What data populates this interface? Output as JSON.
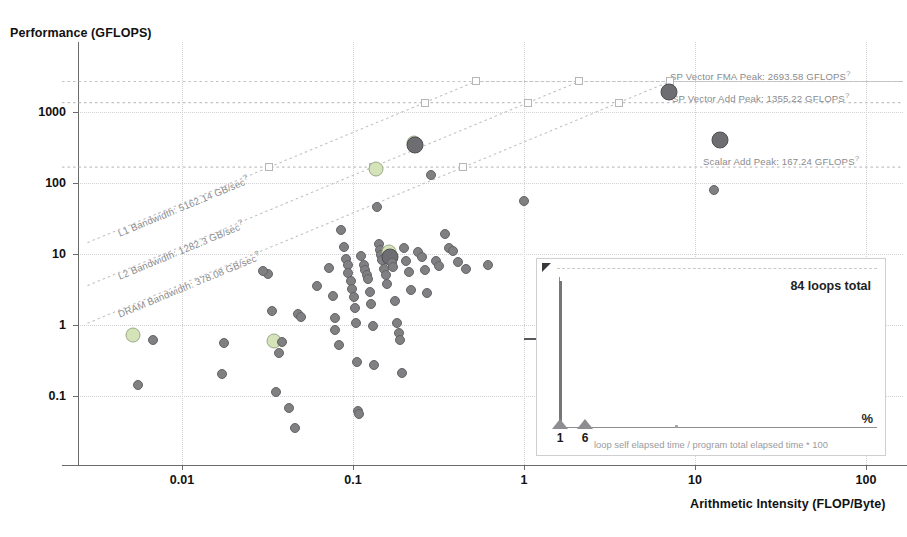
{
  "chart_data": {
    "type": "scatter",
    "title": "",
    "xlabel": "Arithmetic Intensity (FLOP/Byte)",
    "ylabel": "Performance (GFLOPS)",
    "xscale": "log",
    "yscale": "log",
    "xlim": [
      0.0025,
      160
    ],
    "ylim": [
      0.025,
      4000
    ],
    "xticks": [
      "0.01",
      "0.1",
      "1",
      "10",
      "100"
    ],
    "xtick_values": [
      0.01,
      0.1,
      1,
      10,
      100
    ],
    "yticks": [
      "0.1",
      "1",
      "10",
      "100",
      "1000"
    ],
    "ytick_values": [
      0.1,
      1,
      10,
      100,
      1000
    ],
    "grid": true,
    "legend": "none",
    "roofs": [
      {
        "name": "SP Vector FMA Peak",
        "label": "SP Vector FMA Peak: 2693.58 GFLOPS",
        "value": 2693.58,
        "unit": "GFLOPS",
        "kind": "compute"
      },
      {
        "name": "SP Vector Add Peak",
        "label": "SP Vector Add Peak: 1355.22 GFLOPS",
        "value": 1355.22,
        "unit": "GFLOPS",
        "kind": "compute"
      },
      {
        "name": "Scalar Add Peak",
        "label": "Scalar Add Peak: 167.24 GFLOPS",
        "value": 167.24,
        "unit": "GFLOPS",
        "kind": "compute"
      },
      {
        "name": "L1 Bandwidth",
        "label": "L1 Bandwidth: 5162.14 GB/sec",
        "value": 5162.14,
        "unit": "GB/sec",
        "kind": "memory"
      },
      {
        "name": "L2 Bandwidth",
        "label": "L2 Bandwidth: 1282.3 GB/sec",
        "value": 1282.3,
        "unit": "GB/sec",
        "kind": "memory"
      },
      {
        "name": "DRAM Bandwidth",
        "label": "DRAM Bandwidth: 378.08 GB/sec",
        "value": 378.08,
        "unit": "GB/sec",
        "kind": "memory"
      }
    ],
    "points": [
      {
        "x": 0.0052,
        "y": 0.72,
        "size": "hl"
      },
      {
        "x": 0.0068,
        "y": 0.62,
        "size": "norm"
      },
      {
        "x": 0.0055,
        "y": 0.145,
        "size": "norm"
      },
      {
        "x": 0.0175,
        "y": 0.55,
        "size": "norm"
      },
      {
        "x": 0.0172,
        "y": 0.205,
        "size": "norm"
      },
      {
        "x": 0.0345,
        "y": 0.6,
        "size": "hl"
      },
      {
        "x": 0.0385,
        "y": 0.58,
        "size": "norm"
      },
      {
        "x": 0.0335,
        "y": 1.55,
        "size": "norm"
      },
      {
        "x": 0.0318,
        "y": 5.2,
        "size": "norm"
      },
      {
        "x": 0.0298,
        "y": 5.8,
        "size": "norm"
      },
      {
        "x": 0.0368,
        "y": 0.4,
        "size": "norm"
      },
      {
        "x": 0.0355,
        "y": 0.115,
        "size": "norm"
      },
      {
        "x": 0.042,
        "y": 0.068,
        "size": "norm"
      },
      {
        "x": 0.0455,
        "y": 0.036,
        "size": "norm"
      },
      {
        "x": 0.0475,
        "y": 1.45,
        "size": "norm"
      },
      {
        "x": 0.0495,
        "y": 1.3,
        "size": "norm"
      },
      {
        "x": 0.062,
        "y": 3.6,
        "size": "norm"
      },
      {
        "x": 0.072,
        "y": 6.4,
        "size": "norm"
      },
      {
        "x": 0.076,
        "y": 2.6,
        "size": "norm"
      },
      {
        "x": 0.078,
        "y": 1.25,
        "size": "norm"
      },
      {
        "x": 0.079,
        "y": 0.85,
        "size": "norm"
      },
      {
        "x": 0.083,
        "y": 0.52,
        "size": "norm"
      },
      {
        "x": 0.085,
        "y": 22.0,
        "size": "norm"
      },
      {
        "x": 0.088,
        "y": 12.5,
        "size": "norm"
      },
      {
        "x": 0.091,
        "y": 8.6,
        "size": "norm"
      },
      {
        "x": 0.093,
        "y": 6.9,
        "size": "norm"
      },
      {
        "x": 0.094,
        "y": 5.4,
        "size": "norm"
      },
      {
        "x": 0.097,
        "y": 4.1,
        "size": "norm"
      },
      {
        "x": 0.099,
        "y": 3.2,
        "size": "norm"
      },
      {
        "x": 0.101,
        "y": 2.5,
        "size": "norm"
      },
      {
        "x": 0.103,
        "y": 1.75,
        "size": "norm"
      },
      {
        "x": 0.104,
        "y": 1.05,
        "size": "norm"
      },
      {
        "x": 0.106,
        "y": 0.3,
        "size": "norm"
      },
      {
        "x": 0.107,
        "y": 0.062,
        "size": "norm"
      },
      {
        "x": 0.108,
        "y": 0.055,
        "size": "norm"
      },
      {
        "x": 0.112,
        "y": 9.5,
        "size": "norm"
      },
      {
        "x": 0.116,
        "y": 7.1,
        "size": "norm"
      },
      {
        "x": 0.118,
        "y": 5.9,
        "size": "norm"
      },
      {
        "x": 0.121,
        "y": 5.1,
        "size": "norm"
      },
      {
        "x": 0.123,
        "y": 4.4,
        "size": "norm"
      },
      {
        "x": 0.126,
        "y": 2.9,
        "size": "norm"
      },
      {
        "x": 0.128,
        "y": 1.95,
        "size": "norm"
      },
      {
        "x": 0.131,
        "y": 0.98,
        "size": "norm"
      },
      {
        "x": 0.133,
        "y": 0.27,
        "size": "norm"
      },
      {
        "x": 0.136,
        "y": 158.0,
        "size": "hl"
      },
      {
        "x": 0.138,
        "y": 46.0,
        "size": "norm"
      },
      {
        "x": 0.141,
        "y": 14.0,
        "size": "norm"
      },
      {
        "x": 0.143,
        "y": 11.5,
        "size": "norm"
      },
      {
        "x": 0.146,
        "y": 9.8,
        "size": "norm"
      },
      {
        "x": 0.148,
        "y": 8.2,
        "size": "norm"
      },
      {
        "x": 0.152,
        "y": 6.2,
        "size": "norm"
      },
      {
        "x": 0.155,
        "y": 5.0,
        "size": "norm"
      },
      {
        "x": 0.158,
        "y": 3.8,
        "size": "norm"
      },
      {
        "x": 0.162,
        "y": 10.5,
        "size": "hl"
      },
      {
        "x": 0.165,
        "y": 9.2,
        "size": "big"
      },
      {
        "x": 0.168,
        "y": 7.5,
        "size": "norm"
      },
      {
        "x": 0.172,
        "y": 6.6,
        "size": "norm"
      },
      {
        "x": 0.176,
        "y": 2.2,
        "size": "norm"
      },
      {
        "x": 0.181,
        "y": 1.08,
        "size": "norm"
      },
      {
        "x": 0.185,
        "y": 0.78,
        "size": "norm"
      },
      {
        "x": 0.189,
        "y": 0.62,
        "size": "norm"
      },
      {
        "x": 0.193,
        "y": 0.21,
        "size": "norm"
      },
      {
        "x": 0.198,
        "y": 12.2,
        "size": "norm"
      },
      {
        "x": 0.205,
        "y": 8.0,
        "size": "norm"
      },
      {
        "x": 0.212,
        "y": 5.6,
        "size": "norm"
      },
      {
        "x": 0.218,
        "y": 3.1,
        "size": "norm"
      },
      {
        "x": 0.226,
        "y": 370.0,
        "size": "hl"
      },
      {
        "x": 0.232,
        "y": 345.0,
        "size": "big"
      },
      {
        "x": 0.241,
        "y": 10.8,
        "size": "norm"
      },
      {
        "x": 0.252,
        "y": 9.0,
        "size": "norm"
      },
      {
        "x": 0.262,
        "y": 5.9,
        "size": "norm"
      },
      {
        "x": 0.272,
        "y": 2.8,
        "size": "norm"
      },
      {
        "x": 0.285,
        "y": 130.0,
        "size": "norm"
      },
      {
        "x": 0.305,
        "y": 7.9,
        "size": "norm"
      },
      {
        "x": 0.318,
        "y": 6.8,
        "size": "norm"
      },
      {
        "x": 0.345,
        "y": 19.0,
        "size": "norm"
      },
      {
        "x": 0.362,
        "y": 12.0,
        "size": "norm"
      },
      {
        "x": 0.382,
        "y": 11.2,
        "size": "norm"
      },
      {
        "x": 0.412,
        "y": 7.8,
        "size": "norm"
      },
      {
        "x": 0.455,
        "y": 6.2,
        "size": "norm"
      },
      {
        "x": 0.62,
        "y": 7.0,
        "size": "norm"
      },
      {
        "x": 1.0,
        "y": 56.0,
        "size": "norm"
      },
      {
        "x": 7.0,
        "y": 1900.0,
        "size": "big"
      },
      {
        "x": 14.0,
        "y": 400.0,
        "size": "big"
      },
      {
        "x": 13.0,
        "y": 80.0,
        "size": "norm"
      }
    ]
  },
  "inset": {
    "loops_total": "84 loops total",
    "percent_symbol": "%",
    "caption": "loop self elapsed time / program total elapsed time * 100",
    "ticks": [
      "1",
      "6"
    ]
  },
  "colors": {
    "dot_fill": "#808083",
    "dot_highlight": "#d4e4b8",
    "roof_line": "#c2c2c6",
    "grid": "#d2d2d4",
    "axis": "#6b6b6b",
    "text": "#1a1a1a",
    "roof_label": "#8a8a8c"
  }
}
